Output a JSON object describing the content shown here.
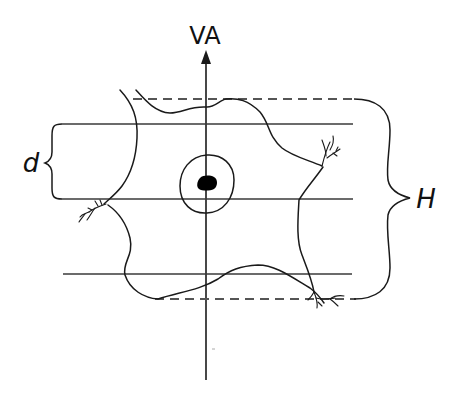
{
  "diagram": {
    "axis_label": "VA",
    "left_brace_label": "d",
    "right_brace_label": "H",
    "colors": {
      "stroke": "#1a1a1a",
      "dashed": "#555555",
      "line": "#3a3a3a",
      "fill": "#000000",
      "background": "#ffffff"
    },
    "elements": {
      "vertical_axis": "VA axis with upward arrow",
      "horizontal_lines": 3,
      "dashed_bounds": 2,
      "cell_outline": "irregular cell body with dendritic branches",
      "nucleus": "circle with dark nucleolus"
    }
  }
}
